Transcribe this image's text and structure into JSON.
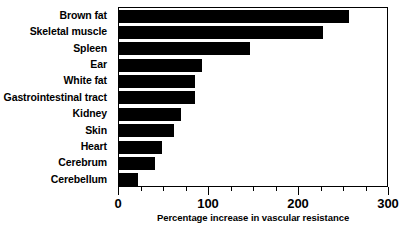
{
  "chart_data": {
    "type": "bar",
    "orientation": "horizontal",
    "title": "",
    "xlabel": "Percentage increase in vascular resistance",
    "ylabel": "",
    "xlim": [
      0,
      300
    ],
    "xticks": [
      0,
      100,
      200,
      300
    ],
    "xtick_labels": [
      "0",
      "100",
      "200",
      "300"
    ],
    "minor_tick_interval": 25,
    "grid": false,
    "legend": null,
    "bar_color": "#000000",
    "background_color": "#ffffff",
    "axis_color": "#000000",
    "categories": [
      "Brown fat",
      "Skeletal muscle",
      "Spleen",
      "Ear",
      "White fat",
      "Gastrointestinal tract",
      "Kidney",
      "Skin",
      "Heart",
      "Cerebrum",
      "Cerebellum"
    ],
    "values": [
      256,
      227,
      145,
      92,
      84,
      84,
      69,
      61,
      48,
      40,
      21
    ]
  }
}
